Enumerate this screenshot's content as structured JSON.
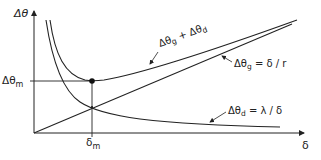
{
  "diagram": {
    "y_axis_label": "Δθ",
    "x_axis_label": "δ",
    "min_y_label": "Δθ",
    "min_y_sub": "m",
    "min_x_label": "δ",
    "min_x_sub": "m",
    "curves": {
      "sum": {
        "label": "Δθ",
        "sub1": "g",
        "plus": " + Δθ",
        "sub2": "d"
      },
      "linear": {
        "label": "Δθ",
        "sub": "g",
        "eq": " = δ / r"
      },
      "inverse": {
        "label": "Δθ",
        "sub": "d",
        "eq": " = λ / δ"
      }
    },
    "colors": {
      "ink": "#222222",
      "background": "#ffffff"
    }
  }
}
